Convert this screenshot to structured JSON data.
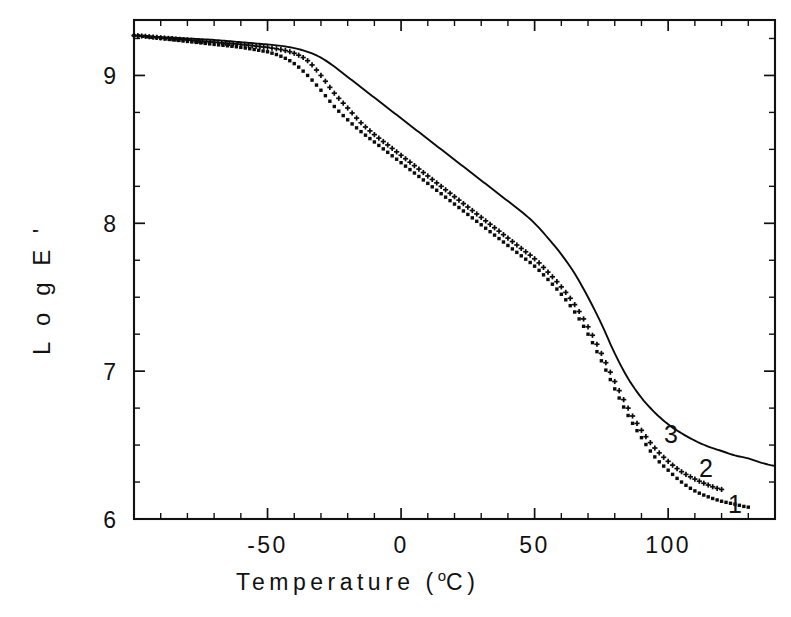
{
  "chart_data": {
    "type": "line",
    "title": "",
    "xlabel": "Temperature (°C)",
    "ylabel": "Log E'",
    "xlim": [
      -100,
      140
    ],
    "ylim": [
      6,
      9.375
    ],
    "grid": false,
    "legend_position": "inline-right-labels",
    "x_major_ticks": [
      -50,
      0,
      50,
      100
    ],
    "x_major_tick_labels": [
      "-50",
      "0",
      "50",
      "100"
    ],
    "x_minor_tick_interval": 10,
    "y_major_ticks": [
      6,
      7,
      8,
      9
    ],
    "y_major_tick_labels": [
      "6",
      "7",
      "8",
      "9"
    ],
    "y_minor_tick_interval": 0.25,
    "series": [
      {
        "name": "1",
        "label": "1",
        "marker": "square-dot",
        "style": "dotted-markers",
        "x": [
          -100,
          -90,
          -80,
          -70,
          -60,
          -50,
          -45,
          -40,
          -35,
          -30,
          -25,
          -20,
          -15,
          -10,
          -5,
          0,
          5,
          10,
          15,
          20,
          25,
          30,
          35,
          40,
          45,
          50,
          55,
          60,
          65,
          70,
          75,
          80,
          85,
          90,
          95,
          100,
          105,
          110,
          115,
          120,
          125,
          130
        ],
        "y": [
          9.27,
          9.25,
          9.23,
          9.21,
          9.19,
          9.16,
          9.13,
          9.08,
          9.0,
          8.9,
          8.79,
          8.7,
          8.62,
          8.55,
          8.48,
          8.41,
          8.34,
          8.27,
          8.2,
          8.13,
          8.06,
          7.99,
          7.92,
          7.85,
          7.78,
          7.71,
          7.62,
          7.52,
          7.4,
          7.25,
          7.07,
          6.88,
          6.7,
          6.55,
          6.42,
          6.33,
          6.25,
          6.19,
          6.15,
          6.12,
          6.1,
          6.08
        ]
      },
      {
        "name": "2",
        "label": "2",
        "marker": "plus",
        "style": "plus-markers",
        "x": [
          -100,
          -90,
          -80,
          -70,
          -60,
          -50,
          -45,
          -40,
          -35,
          -30,
          -25,
          -20,
          -15,
          -10,
          -5,
          0,
          5,
          10,
          15,
          20,
          25,
          30,
          35,
          40,
          45,
          50,
          55,
          60,
          65,
          70,
          75,
          80,
          85,
          90,
          95,
          100,
          105,
          110,
          115,
          120
        ],
        "y": [
          9.27,
          9.255,
          9.24,
          9.225,
          9.21,
          9.19,
          9.175,
          9.15,
          9.1,
          9.0,
          8.88,
          8.78,
          8.68,
          8.6,
          8.53,
          8.46,
          8.39,
          8.32,
          8.25,
          8.18,
          8.11,
          8.04,
          7.97,
          7.9,
          7.83,
          7.76,
          7.67,
          7.57,
          7.45,
          7.3,
          7.12,
          6.93,
          6.75,
          6.6,
          6.48,
          6.39,
          6.32,
          6.27,
          6.23,
          6.2
        ]
      },
      {
        "name": "3",
        "label": "3",
        "marker": "none",
        "style": "thin-solid-line",
        "x": [
          -100,
          -90,
          -80,
          -70,
          -60,
          -50,
          -45,
          -40,
          -35,
          -30,
          -25,
          -20,
          -15,
          -10,
          -5,
          0,
          5,
          10,
          15,
          20,
          25,
          30,
          35,
          40,
          45,
          50,
          55,
          60,
          65,
          70,
          75,
          80,
          85,
          90,
          95,
          100,
          105,
          110,
          115,
          120,
          125,
          130,
          135,
          140
        ],
        "y": [
          9.27,
          9.26,
          9.25,
          9.24,
          9.225,
          9.21,
          9.2,
          9.185,
          9.16,
          9.12,
          9.06,
          8.99,
          8.92,
          8.85,
          8.78,
          8.71,
          8.64,
          8.57,
          8.5,
          8.43,
          8.36,
          8.29,
          8.22,
          8.15,
          8.08,
          8.0,
          7.9,
          7.79,
          7.66,
          7.5,
          7.32,
          7.12,
          6.95,
          6.82,
          6.72,
          6.64,
          6.58,
          6.53,
          6.49,
          6.46,
          6.43,
          6.41,
          6.38,
          6.36
        ]
      }
    ]
  },
  "axis": {
    "x_title_text": "Temperature (",
    "x_title_degree": "o",
    "x_title_unit": "C)",
    "y_title_letters": [
      "L",
      "o",
      "g",
      "E",
      "'"
    ]
  }
}
